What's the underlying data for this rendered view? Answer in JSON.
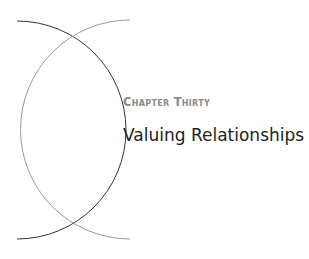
{
  "chapter": {
    "label": "Chapter Thirty",
    "title": "Valuing Relationships"
  },
  "decor": {
    "dark_arc_color": "#333333",
    "light_arc_color": "#9a9a9a"
  }
}
